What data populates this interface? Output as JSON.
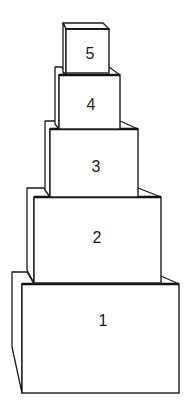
{
  "diagram": {
    "title": "",
    "stroke_color": "#1a1a1a",
    "background": "#ffffff",
    "boxes": [
      {
        "label": "1",
        "front": {
          "x": 22,
          "y": 284,
          "w": 157,
          "h": 109
        },
        "side": "12,272 27,272 34,284 22,284 22,393 12,347",
        "top_right": "161,276 179,284",
        "label_pos": {
          "x": 103,
          "y": 322
        }
      },
      {
        "label": "2",
        "front": {
          "x": 34,
          "y": 197,
          "w": 127,
          "h": 86
        },
        "side": "27,188 44,188 50,197 34,197 34,283 27,270",
        "top_right": "138,188 161,197",
        "label_pos": {
          "x": 97,
          "y": 239
        }
      },
      {
        "label": "3",
        "front": {
          "x": 50,
          "y": 129,
          "w": 88,
          "h": 68
        },
        "side": "45,121 55,121 59,129 50,129 50,197 45,190",
        "top_right": "120,121 138,129",
        "label_pos": {
          "x": 96,
          "y": 168
        }
      },
      {
        "label": "4",
        "front": {
          "x": 59,
          "y": 75,
          "w": 61,
          "h": 54
        },
        "side": "55,67 62,67 66,75 59,75 59,129 55,124",
        "top_right": "109,67 120,75",
        "label_pos": {
          "x": 91,
          "y": 106
        }
      },
      {
        "label": "5",
        "front": {
          "x": 66,
          "y": 29,
          "w": 43,
          "h": 44
        },
        "side": "63,23 103,23 109,29 66,29 66,73 63,73",
        "top_right": "103,23 109,29",
        "label_pos": {
          "x": 90,
          "y": 55
        }
      }
    ]
  }
}
